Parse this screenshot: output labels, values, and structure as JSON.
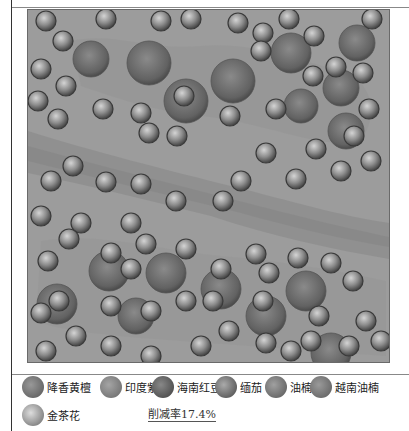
{
  "figure": {
    "title": "",
    "background_color": "#9a9a9a",
    "river_color": "#8a8a8a"
  },
  "legend": {
    "items": [
      {
        "label": "降香黄檀",
        "color": "#6e6e6e"
      },
      {
        "label": "印度紫檀",
        "color": "#7c7c7c"
      },
      {
        "label": "海南红豆",
        "color": "#5c5c5c"
      },
      {
        "label": "缅茄",
        "color": "#666666"
      },
      {
        "label": "油楠",
        "color": "#707070"
      },
      {
        "label": "越南油楠",
        "color": "#767676"
      },
      {
        "label": "金茶花",
        "color": "#8c8c8c"
      }
    ],
    "reduction_rate": "削减率17.4%"
  },
  "trees": {
    "small": [
      [
        45,
        20
      ],
      [
        62,
        40
      ],
      [
        105,
        18
      ],
      [
        160,
        20
      ],
      [
        190,
        18
      ],
      [
        237,
        22
      ],
      [
        262,
        32
      ],
      [
        288,
        18
      ],
      [
        313,
        35
      ],
      [
        371,
        18
      ],
      [
        40,
        68
      ],
      [
        65,
        85
      ],
      [
        37,
        100
      ],
      [
        57,
        118
      ],
      [
        102,
        108
      ],
      [
        140,
        112
      ],
      [
        148,
        132
      ],
      [
        176,
        135
      ],
      [
        183,
        95
      ],
      [
        229,
        115
      ],
      [
        260,
        50
      ],
      [
        275,
        108
      ],
      [
        312,
        75
      ],
      [
        335,
        66
      ],
      [
        362,
        72
      ],
      [
        368,
        108
      ],
      [
        353,
        135
      ],
      [
        240,
        180
      ],
      [
        265,
        152
      ],
      [
        295,
        178
      ],
      [
        315,
        148
      ],
      [
        340,
        170
      ],
      [
        370,
        160
      ],
      [
        72,
        165
      ],
      [
        50,
        180
      ],
      [
        105,
        181
      ],
      [
        140,
        183
      ],
      [
        175,
        200
      ],
      [
        222,
        200
      ],
      [
        130,
        222
      ],
      [
        40,
        215
      ],
      [
        80,
        222
      ],
      [
        68,
        238
      ],
      [
        110,
        252
      ],
      [
        145,
        243
      ],
      [
        185,
        248
      ],
      [
        47,
        260
      ],
      [
        58,
        300
      ],
      [
        110,
        305
      ],
      [
        150,
        310
      ],
      [
        185,
        300
      ],
      [
        220,
        268
      ],
      [
        255,
        253
      ],
      [
        268,
        272
      ],
      [
        297,
        257
      ],
      [
        330,
        262
      ],
      [
        352,
        280
      ],
      [
        318,
        315
      ],
      [
        212,
        300
      ],
      [
        228,
        330
      ],
      [
        200,
        345
      ],
      [
        150,
        355
      ],
      [
        110,
        345
      ],
      [
        75,
        335
      ],
      [
        45,
        350
      ],
      [
        265,
        342
      ],
      [
        290,
        350
      ],
      [
        310,
        340
      ],
      [
        348,
        345
      ],
      [
        380,
        340
      ],
      [
        365,
        320
      ],
      [
        40,
        312
      ],
      [
        262,
        300
      ],
      [
        130,
        268
      ]
    ],
    "large": [
      [
        90,
        58,
        18
      ],
      [
        148,
        62,
        22
      ],
      [
        185,
        100,
        22
      ],
      [
        232,
        80,
        22
      ],
      [
        290,
        52,
        20
      ],
      [
        356,
        42,
        18
      ],
      [
        300,
        105,
        17
      ],
      [
        340,
        87,
        18
      ],
      [
        345,
        130,
        18
      ],
      [
        108,
        270,
        20
      ],
      [
        165,
        272,
        20
      ],
      [
        220,
        288,
        20
      ],
      [
        265,
        315,
        20
      ],
      [
        305,
        290,
        20
      ],
      [
        56,
        303,
        20
      ],
      [
        135,
        315,
        18
      ],
      [
        330,
        352,
        20
      ]
    ]
  }
}
